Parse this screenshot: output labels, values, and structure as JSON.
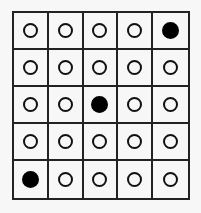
{
  "grid": {
    "rows": 5,
    "cols": 5,
    "line_color": "#222222",
    "background": "#f7f7f7",
    "cells": [
      [
        0,
        0,
        0,
        0,
        1
      ],
      [
        0,
        0,
        0,
        0,
        0
      ],
      [
        0,
        0,
        1,
        0,
        0
      ],
      [
        0,
        0,
        0,
        0,
        0
      ],
      [
        1,
        0,
        0,
        0,
        0
      ]
    ],
    "legend": {
      "0": "empty-circle",
      "1": "filled-circle"
    }
  }
}
